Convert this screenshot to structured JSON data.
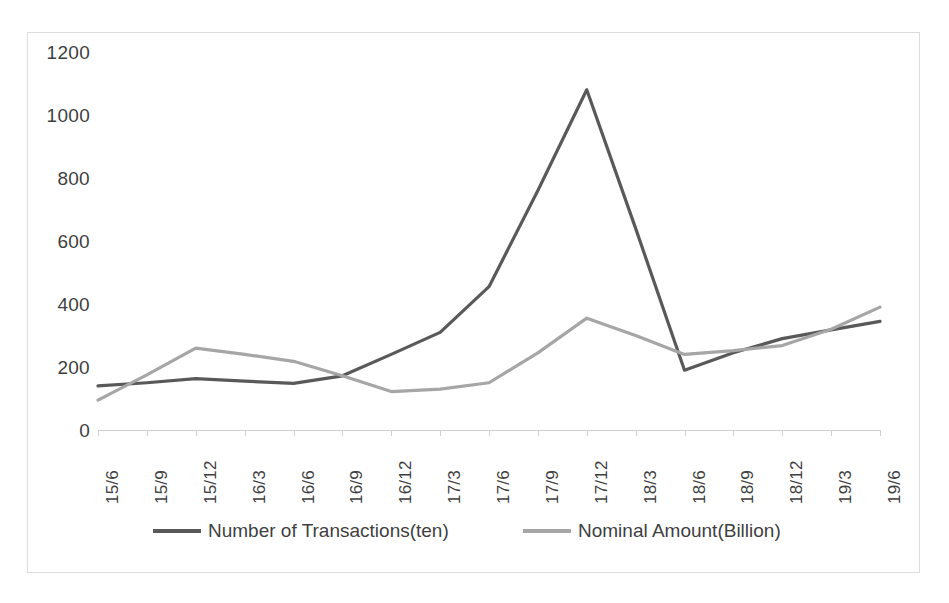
{
  "chart_data": {
    "type": "line",
    "title": "",
    "xlabel": "",
    "ylabel": "",
    "ylim": [
      0,
      1200
    ],
    "yticks": [
      0,
      200,
      400,
      600,
      800,
      1000,
      1200
    ],
    "ytick_labels": [
      "0",
      "200",
      "400",
      "600",
      "800",
      "1000",
      "1200"
    ],
    "grid": false,
    "legend_position": "bottom",
    "categories": [
      "15/6",
      "15/9",
      "15/12",
      "16/3",
      "16/6",
      "16/9",
      "16/12",
      "17/3",
      "17/6",
      "17/9",
      "17/12",
      "18/3",
      "18/6",
      "18/9",
      "18/12",
      "19/3",
      "19/6"
    ],
    "series": [
      {
        "name": "Number of Transactions(ten)",
        "color": "#595959",
        "values": [
          140,
          150,
          163,
          155,
          148,
          172,
          240,
          310,
          455,
          760,
          1080,
          640,
          190,
          245,
          290,
          318,
          345
        ]
      },
      {
        "name": "Nominal Amount(Billion)",
        "color": "#a6a6a6",
        "values": [
          95,
          175,
          260,
          240,
          218,
          172,
          122,
          130,
          150,
          245,
          355,
          300,
          240,
          252,
          268,
          320,
          390
        ]
      }
    ]
  },
  "legend": {
    "items": [
      {
        "label": "Number of Transactions(ten)",
        "color": "#595959"
      },
      {
        "label": "Nominal Amount(Billion)",
        "color": "#a6a6a6"
      }
    ]
  },
  "frame": {
    "border_color": "#dcdcdc",
    "background": "#ffffff"
  }
}
